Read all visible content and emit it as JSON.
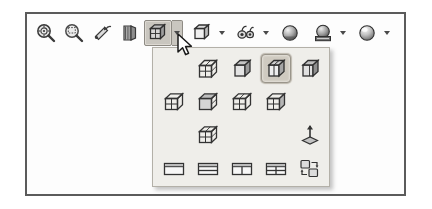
{
  "app": {
    "context": "cad-view-toolbar-with-display-style-flyout",
    "colors": {
      "page_background": "#ffffff",
      "frame_border": "#5b5b5b",
      "toolbar_background": "#fdfdfd",
      "flyout_background": "#efeeea",
      "flyout_border": "#b3b0a8",
      "selection_highlight": "#cfcac0",
      "pressed_button": "#c9c6bf",
      "icon_line": "#3a3a3a"
    }
  },
  "toolbar": {
    "name": "View (Heads-Up) toolbar",
    "items": [
      {
        "icon": "zoom-to-fit-icon",
        "label": "Zoom to Fit",
        "has_dropdown": false,
        "pressed": false
      },
      {
        "icon": "zoom-to-area-icon",
        "label": "Zoom to Area",
        "has_dropdown": false,
        "pressed": false
      },
      {
        "icon": "previous-view-icon",
        "label": "Previous View",
        "has_dropdown": false,
        "pressed": false
      },
      {
        "icon": "section-view-icon",
        "label": "Section View",
        "has_dropdown": false,
        "pressed": false
      },
      {
        "icon": "view-orientation-icon",
        "label": "View Orientation",
        "has_dropdown": true,
        "pressed": true
      },
      {
        "icon": "display-style-icon",
        "label": "Display Style",
        "has_dropdown": true,
        "pressed": false
      },
      {
        "icon": "hide-show-items-icon",
        "label": "Hide/Show Items",
        "has_dropdown": true,
        "pressed": false
      },
      {
        "icon": "edit-appearance-icon",
        "label": "Edit Appearance",
        "has_dropdown": false,
        "pressed": false
      },
      {
        "icon": "apply-scene-icon",
        "label": "Apply Scene",
        "has_dropdown": true,
        "pressed": false
      },
      {
        "icon": "view-settings-icon",
        "label": "View Settings",
        "has_dropdown": true,
        "pressed": false
      }
    ]
  },
  "flyout": {
    "name": "View Orientation flyout",
    "columns": 5,
    "rows": [
      {
        "row_name": "standard-views-row-1",
        "cells": [
          {
            "icon": "empty-cell",
            "label": "",
            "present": false,
            "selected": false
          },
          {
            "icon": "normal-to-icon",
            "label": "Normal To",
            "present": true,
            "selected": false
          },
          {
            "icon": "front-view-icon",
            "label": "Front",
            "present": true,
            "selected": false
          },
          {
            "icon": "isometric-view-icon",
            "label": "Isometric",
            "present": true,
            "selected": true
          },
          {
            "icon": "trimetric-view-icon",
            "label": "Trimetric",
            "present": true,
            "selected": false
          }
        ]
      },
      {
        "row_name": "standard-views-row-2",
        "cells": [
          {
            "icon": "left-view-icon",
            "label": "Left",
            "present": true,
            "selected": false
          },
          {
            "icon": "top-view-icon",
            "label": "Top",
            "present": true,
            "selected": false
          },
          {
            "icon": "right-view-icon",
            "label": "Right",
            "present": true,
            "selected": false
          },
          {
            "icon": "back-view-icon",
            "label": "Back",
            "present": true,
            "selected": false
          },
          {
            "icon": "empty-cell",
            "label": "",
            "present": false,
            "selected": false
          }
        ]
      },
      {
        "row_name": "standard-views-row-3",
        "cells": [
          {
            "icon": "empty-cell",
            "label": "",
            "present": false,
            "selected": false
          },
          {
            "icon": "bottom-view-icon",
            "label": "Bottom",
            "present": true,
            "selected": false
          },
          {
            "icon": "empty-cell",
            "label": "",
            "present": false,
            "selected": false
          },
          {
            "icon": "empty-cell",
            "label": "",
            "present": false,
            "selected": false
          },
          {
            "icon": "normal-to-axis-icon",
            "label": "Normal To",
            "present": true,
            "selected": false
          }
        ]
      },
      {
        "row_name": "viewport-layout-row",
        "cells": [
          {
            "icon": "single-view-icon",
            "label": "Single View",
            "present": true,
            "selected": false
          },
          {
            "icon": "two-view-horizontal-icon",
            "label": "Two View - Horizontal",
            "present": true,
            "selected": false
          },
          {
            "icon": "two-view-vertical-icon",
            "label": "Two View - Vertical",
            "present": true,
            "selected": false
          },
          {
            "icon": "four-view-icon",
            "label": "Four View",
            "present": true,
            "selected": false
          },
          {
            "icon": "link-views-icon",
            "label": "Link Views",
            "present": true,
            "selected": false
          }
        ]
      }
    ]
  },
  "cursor": {
    "name": "mouse-pointer",
    "shape": "arrow",
    "x": 176,
    "y": 33
  }
}
